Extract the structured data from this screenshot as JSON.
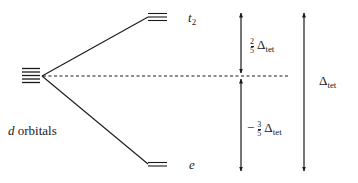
{
  "diagram": {
    "type": "crystal-field-splitting",
    "title": "",
    "degenerate_level": {
      "label": "d orbitals",
      "label_italic": "d",
      "label_rest": " orbitals",
      "line_count": 5
    },
    "upper_level": {
      "label": "t",
      "label_sub": "2",
      "line_count": 3
    },
    "lower_level": {
      "label": "e",
      "line_count": 2
    },
    "upper_gap": {
      "prefix": "",
      "frac_num": "2",
      "frac_den": "5",
      "symbol": "Δ",
      "sub": "tet"
    },
    "lower_gap": {
      "prefix": "−",
      "frac_num": "3",
      "frac_den": "5",
      "symbol": "Δ",
      "sub": "tet"
    },
    "total_gap": {
      "symbol": "Δ",
      "sub": "tet"
    },
    "colors": {
      "line": "#1a1a1a",
      "background": "#ffffff"
    }
  }
}
